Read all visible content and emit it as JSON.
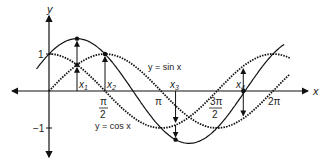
{
  "chart_data": {
    "type": "line",
    "title": "",
    "xlabel": "x",
    "ylabel": "y",
    "x_ticks": [
      "π/2",
      "π",
      "3π/2",
      "2π"
    ],
    "y_ticks": [
      "1",
      "−1"
    ],
    "xlim": [
      -0.6,
      2.35
    ],
    "ylim": [
      -1.5,
      2.0
    ],
    "series": [
      {
        "name": "y = sin x",
        "style": "dotted",
        "function": "sin x"
      },
      {
        "name": "y = cos x",
        "style": "dotted",
        "function": "cos x"
      },
      {
        "name": "y = sin x + cos x",
        "style": "solid",
        "function": "sin x + cos x"
      }
    ],
    "annotations": [
      {
        "label": "x₁",
        "x": "π/4",
        "note": "arrow from cos curve to sum"
      },
      {
        "label": "x₂",
        "x": "π/2",
        "note": "arrow from x-axis to sum"
      },
      {
        "label": "x₃",
        "x": "≈3.6",
        "note": "arrows down to sum minimum"
      },
      {
        "label": "x₄",
        "x": "≈5.5",
        "note": "arrows between curves"
      }
    ],
    "grid": false,
    "legend": "inline labels"
  },
  "labels": {
    "y_axis": "y",
    "x_axis": "x",
    "one": "1",
    "neg_one": "−1",
    "pi_half_num": "π",
    "pi_half_den": "2",
    "pi": "π",
    "three_pi_half_num": "3π",
    "three_pi_half_den": "2",
    "two_pi": "2π",
    "sin_label": "y = sin x",
    "cos_label": "y = cos x",
    "x1": "x",
    "x1_sub": "1",
    "x2": "x",
    "x2_sub": "2",
    "x3": "x",
    "x3_sub": "3",
    "x4": "x",
    "x4_sub": "4"
  }
}
